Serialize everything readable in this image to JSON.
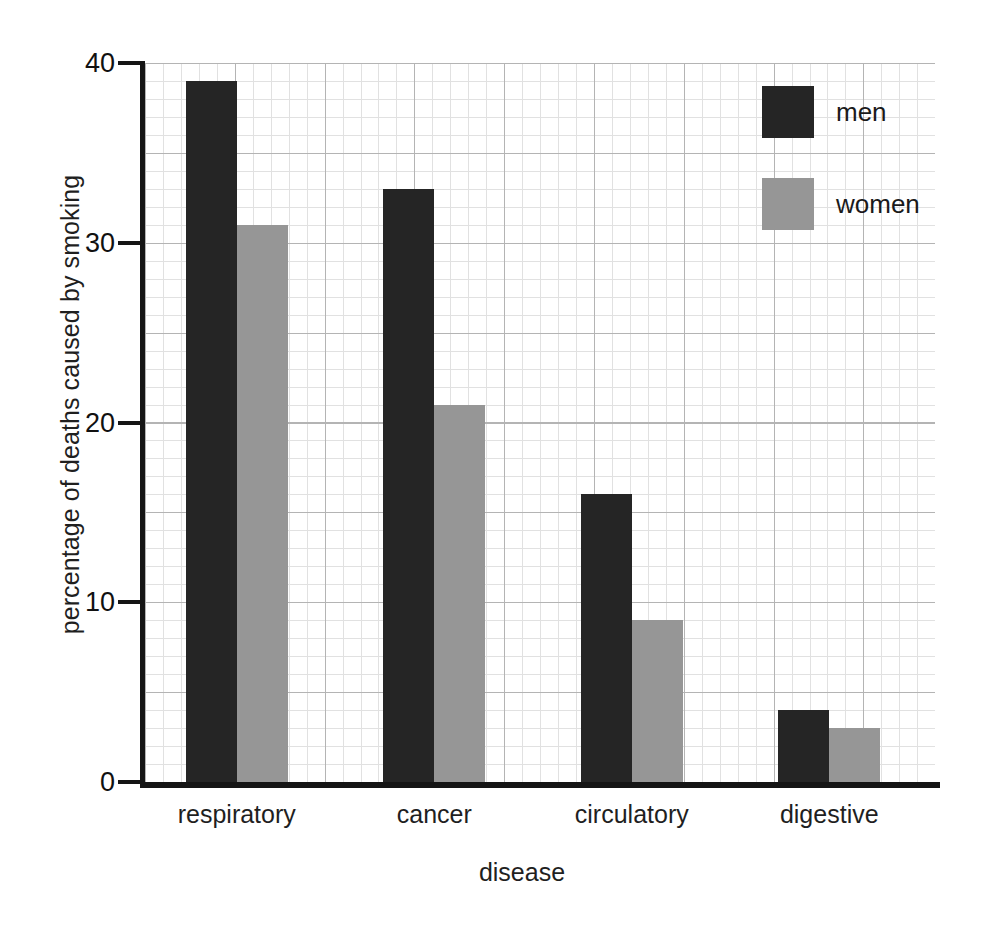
{
  "chart_data": {
    "type": "bar",
    "title": "",
    "xlabel": "disease",
    "ylabel": "percentage of deaths caused by smoking",
    "categories": [
      "respiratory",
      "cancer",
      "circulatory",
      "digestive"
    ],
    "series": [
      {
        "name": "men",
        "color": "#252525",
        "values": [
          39,
          33,
          16,
          4
        ]
      },
      {
        "name": "women",
        "color": "#969696",
        "values": [
          31,
          21,
          9,
          3
        ]
      }
    ],
    "ylim": [
      0,
      40
    ],
    "yticks": [
      0,
      10,
      20,
      30,
      40
    ],
    "ytick_labels": [
      "0",
      "10",
      "20",
      "30",
      "40"
    ],
    "grid": "both-axes-minor-and-major",
    "minor_grid_step": 1,
    "major_grid_step": 5,
    "legend_position": "top-right-inside",
    "legend": [
      {
        "label": "men",
        "color": "#252525"
      },
      {
        "label": "women",
        "color": "#969696"
      }
    ]
  },
  "colors": {
    "men": "#252525",
    "women": "#969696",
    "axis": "#151515",
    "grid_minor": "#d7d7d7",
    "grid_major": "#b4b4b4",
    "background": "#ffffff"
  }
}
